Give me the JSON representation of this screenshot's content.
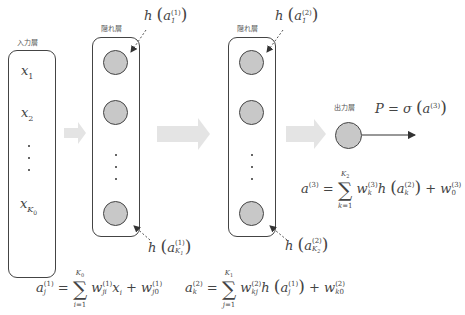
{
  "labels": {
    "input_layer": "入力層",
    "hidden_layer_1": "隠れ層",
    "hidden_layer_2": "隠れ層",
    "output_layer": "出力層"
  },
  "input_nodes": [
    "x₁",
    "x₂",
    "⋮",
    "x_K₀"
  ],
  "annotations": {
    "h1_top": "h(a₁⁽¹⁾)",
    "h1_bottom": "h(a_K₁⁽¹⁾)",
    "h2_top": "h(a₁⁽²⁾)",
    "h2_bottom": "h(a_K₂⁽²⁾)",
    "output": "P = σ(a⁽³⁾)"
  },
  "equations": {
    "a1": "a_j⁽¹⁾ = Σ_{i=1}^{K₀} w_ji⁽¹⁾ x_i + w_j0⁽¹⁾",
    "a2": "a_k⁽²⁾ = Σ_{j=1}^{K₁} w_kj⁽²⁾ h(a_j⁽¹⁾) + w_k0⁽²⁾",
    "a3": "a⁽³⁾ = Σ_{k=1}^{K₂} w_k⁽³⁾ h(a_k⁽²⁾) + w_0⁽³⁾"
  },
  "colors": {
    "node_fill": "#c8c8c8",
    "arrow_fill": "#e4e4e4",
    "stroke": "#444444"
  }
}
